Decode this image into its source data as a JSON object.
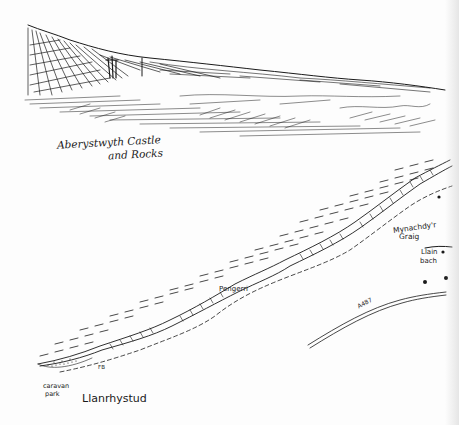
{
  "sketch": {
    "caption_line1": "Aberystwyth Castle",
    "caption_line2": "and Rocks"
  },
  "map": {
    "labels": {
      "mynachdy_line1": "Mynachdy'r",
      "mynachdy_line2": "Graig",
      "llain_line1": "Llain",
      "llain_line2": "bach",
      "pengerri": "Pengerri",
      "road": "A487",
      "footbridge": "FB",
      "caravan_line1": "caravan",
      "caravan_line2": "park",
      "town": "Llanrhystud"
    }
  },
  "colors": {
    "ink": "#1a1a1a",
    "paper": "#fdfdfd"
  }
}
